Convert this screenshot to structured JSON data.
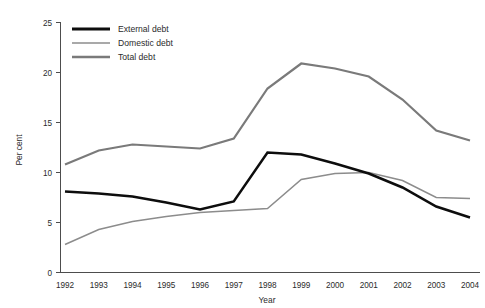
{
  "chart_data": {
    "type": "line",
    "title": "",
    "xlabel": "Year",
    "ylabel": "Per cent",
    "categories": [
      "1992",
      "1993",
      "1994",
      "1995",
      "1996",
      "1997",
      "1998",
      "1999",
      "2000",
      "2001",
      "2002",
      "2003",
      "2004"
    ],
    "x": [
      1992,
      1993,
      1994,
      1995,
      1996,
      1997,
      1998,
      1999,
      2000,
      2001,
      2002,
      2003,
      2004
    ],
    "xlim": [
      1992,
      2004
    ],
    "ylim": [
      0,
      25
    ],
    "yticks": [
      0,
      5,
      10,
      15,
      20,
      25
    ],
    "ytick_labels": [
      "0",
      "5",
      "10",
      "15",
      "20",
      "25"
    ],
    "grid": false,
    "legend_position": "top-left",
    "series": [
      {
        "name": "External debt",
        "color": "#0d0d0d",
        "values": [
          8.1,
          7.9,
          7.6,
          7.0,
          6.3,
          7.1,
          12.0,
          11.8,
          10.9,
          9.9,
          8.5,
          6.6,
          5.5
        ]
      },
      {
        "name": "Domestic debt",
        "color": "#8c8c8c",
        "values": [
          2.8,
          4.3,
          5.1,
          5.6,
          6.0,
          6.2,
          6.4,
          9.3,
          9.9,
          10.0,
          9.2,
          7.5,
          7.4
        ]
      },
      {
        "name": "Total debt",
        "color": "#7a7a7a",
        "values": [
          10.8,
          12.2,
          12.8,
          12.6,
          12.4,
          13.4,
          18.4,
          20.9,
          20.4,
          19.6,
          17.3,
          14.2,
          13.2
        ]
      }
    ]
  },
  "legend": {
    "items": [
      {
        "label": "External debt"
      },
      {
        "label": "Domestic debt"
      },
      {
        "label": "Total debt"
      }
    ]
  },
  "axes": {
    "y_title": "Per cent",
    "x_title": "Year"
  }
}
